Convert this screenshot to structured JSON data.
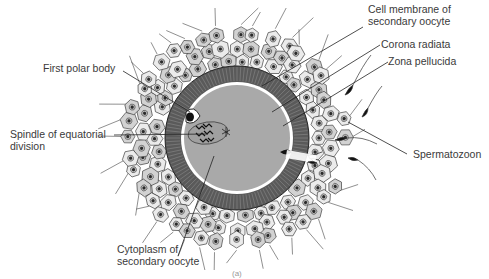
{
  "figure": {
    "panel_label": "(a)",
    "colors": {
      "cytoplasm": "#a9a9a9",
      "zona_pellucida": "#5a5a5a",
      "membrane": "#ffffff",
      "cell_fill": "#e6e6e6",
      "cell_stroke": "#333333",
      "nucleus": "#2a2a2a",
      "label_text": "#3a3a3a",
      "leader_line": "#222222"
    }
  },
  "labels": {
    "cell_membrane": {
      "line1": "Cell membrane of",
      "line2": "secondary oocyte"
    },
    "corona_radiata": {
      "line1": "Corona radiata"
    },
    "zona_pellucida": {
      "line1": "Zona pellucida"
    },
    "first_polar_body": {
      "line1": "First polar body"
    },
    "spindle": {
      "line1": "Spindle of equatorial",
      "line2": "division"
    },
    "spermatozoon": {
      "line1": "Spermatozoon"
    },
    "cytoplasm": {
      "line1": "Cytoplasm of",
      "line2": "secondary oocyte"
    }
  }
}
